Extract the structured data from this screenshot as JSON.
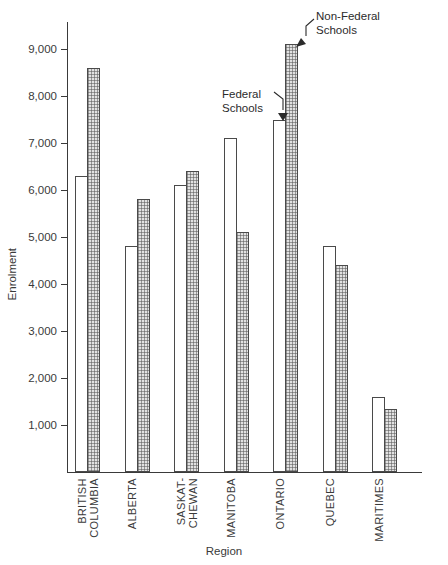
{
  "chart_data": {
    "type": "bar",
    "title": "",
    "xlabel": "Region",
    "ylabel": "Enrolment",
    "ylim": [
      0,
      9600
    ],
    "grid": false,
    "legend_position": "annotations-on-plot",
    "categories": [
      "BRITISH\nCOLUMBIA",
      "ALBERTA",
      "SASKAT-\nCHEWAN",
      "MANITOBA",
      "ONTARIO",
      "QUEBEC",
      "MARITIMES"
    ],
    "series": [
      {
        "name": "Federal Schools",
        "values": [
          6300,
          4800,
          6100,
          7100,
          7500,
          4800,
          1600
        ]
      },
      {
        "name": "Non-Federal Schools",
        "values": [
          8600,
          5800,
          6400,
          5100,
          9100,
          4400,
          1350
        ]
      }
    ],
    "yticks": [
      1000,
      2000,
      3000,
      4000,
      5000,
      6000,
      7000,
      8000,
      9000
    ],
    "ytick_labels": [
      "1,000",
      "2,000",
      "3,000",
      "4,000",
      "5,000",
      "6,000",
      "7,000",
      "8,000",
      "9,000"
    ],
    "annotations": [
      {
        "label": "Federal\nSchools",
        "target_series": "Federal Schools",
        "target_category": "ONTARIO"
      },
      {
        "label": "Non-Federal\nSchools",
        "target_series": "Non-Federal Schools",
        "target_category": "ONTARIO"
      }
    ]
  },
  "colors": {
    "axis": "#3a3a3a",
    "bar_outline": "#4a4a4a",
    "federal_fill": "#ffffff",
    "nonfederal_fill": "#e2e2e2",
    "text": "#2b2b2b"
  }
}
